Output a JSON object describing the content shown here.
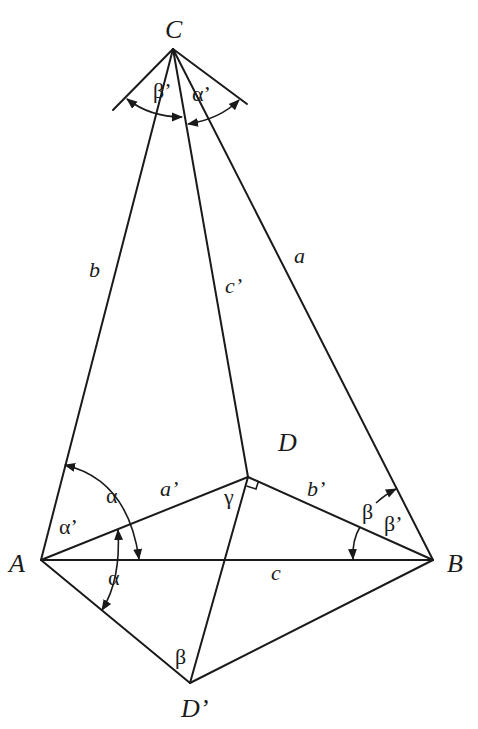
{
  "diagram": {
    "type": "geometry-figure",
    "points": {
      "A": {
        "label": "A",
        "x": 41,
        "y": 560
      },
      "B": {
        "label": "B",
        "x": 433,
        "y": 560
      },
      "C": {
        "label": "C",
        "x": 173,
        "y": 49
      },
      "D": {
        "label": "D",
        "x": 248,
        "y": 477
      },
      "D_prime": {
        "label": "D’",
        "x": 190,
        "y": 683
      }
    },
    "side_labels": {
      "a": "a",
      "b": "b",
      "c": "c",
      "a_prime": "a’",
      "b_prime": "b’",
      "c_prime": "c’"
    },
    "angle_labels": {
      "alpha": "α",
      "alpha_lower": "α",
      "alpha_prime_A": "α’",
      "alpha_prime_C": "α’",
      "beta_B": "β",
      "beta_prime_B": "β’",
      "beta_prime_C": "β’",
      "beta_D_prime": "β",
      "gamma": "γ"
    },
    "edges": [
      [
        "A",
        "C"
      ],
      [
        "B",
        "C"
      ],
      [
        "C",
        "D"
      ],
      [
        "A",
        "B"
      ],
      [
        "A",
        "D"
      ],
      [
        "B",
        "D"
      ],
      [
        "A",
        "D_prime"
      ],
      [
        "B",
        "D_prime"
      ],
      [
        "D",
        "D_prime"
      ]
    ],
    "right_angle_at": "D"
  }
}
